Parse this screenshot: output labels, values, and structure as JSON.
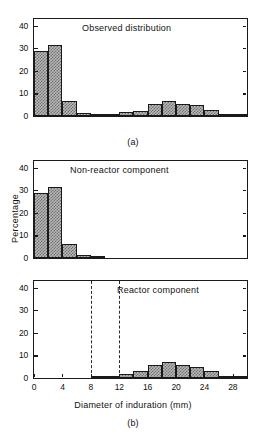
{
  "figure": {
    "y_axis_label": "Percentage",
    "x_axis_label": "Diameter of induration (mm)",
    "label_a": "(a)",
    "label_b": "(b)",
    "y_ticks": [
      0,
      10,
      20,
      30,
      40
    ],
    "x_ticks": [
      0,
      4,
      8,
      12,
      16,
      20,
      24,
      28
    ]
  },
  "chart_data": [
    {
      "type": "bar",
      "title": "Observed distribution",
      "panel": "(a)",
      "xlabel": "",
      "ylabel": "Percentage",
      "xlim": [
        0,
        30
      ],
      "ylim": [
        0,
        43
      ],
      "bin_width": 2,
      "grid": false,
      "legend": "none",
      "bin_starts": [
        0,
        2,
        4,
        6,
        8,
        10,
        12,
        14,
        16,
        18,
        20,
        22,
        24,
        26,
        28
      ],
      "categories": [
        "0-2",
        "2-4",
        "4-6",
        "6-8",
        "8-10",
        "10-12",
        "12-14",
        "14-16",
        "16-18",
        "18-20",
        "20-22",
        "22-24",
        "24-26",
        "26-28",
        "28-30"
      ],
      "values": [
        29,
        31.3,
        6.5,
        1.3,
        0.2,
        0.6,
        1.6,
        2.4,
        5.4,
        6.6,
        5.5,
        4.7,
        2.7,
        0.7,
        0.1
      ]
    },
    {
      "type": "bar",
      "title": "Non-reactor component",
      "panel": "(b-top)",
      "xlabel": "",
      "ylabel": "Percentage",
      "xlim": [
        0,
        30
      ],
      "ylim": [
        0,
        43
      ],
      "bin_width": 2,
      "grid": false,
      "legend": "none",
      "bin_starts": [
        0,
        2,
        4,
        6,
        8,
        10,
        12,
        14,
        16,
        18,
        20,
        22,
        24,
        26,
        28
      ],
      "categories": [
        "0-2",
        "2-4",
        "4-6",
        "6-8",
        "8-10",
        "10-12",
        "12-14",
        "14-16",
        "16-18",
        "18-20",
        "20-22",
        "22-24",
        "24-26",
        "26-28",
        "28-30"
      ],
      "values": [
        29,
        31.3,
        6.4,
        1.3,
        0.1,
        0,
        0,
        0,
        0,
        0,
        0,
        0,
        0,
        0,
        0
      ]
    },
    {
      "type": "bar",
      "title": "Reactor component",
      "panel": "(b-bottom)",
      "xlabel": "Diameter of induration (mm)",
      "ylabel": "Percentage",
      "xlim": [
        0,
        30
      ],
      "ylim": [
        0,
        43
      ],
      "bin_width": 2,
      "grid": false,
      "legend": "none",
      "annotations": [
        {
          "type": "vline",
          "x": 8,
          "style": "dashed"
        },
        {
          "type": "vline",
          "x": 12,
          "style": "dashed"
        }
      ],
      "bin_starts": [
        0,
        2,
        4,
        6,
        8,
        10,
        12,
        14,
        16,
        18,
        20,
        22,
        24,
        26,
        28
      ],
      "categories": [
        "0-2",
        "2-4",
        "4-6",
        "6-8",
        "8-10",
        "10-12",
        "12-14",
        "14-16",
        "16-18",
        "18-20",
        "20-22",
        "22-24",
        "24-26",
        "26-28",
        "28-30"
      ],
      "values": [
        0,
        0,
        0,
        0,
        0.1,
        0.6,
        1.6,
        3.1,
        5.7,
        6.9,
        5.6,
        5.0,
        2.9,
        0.7,
        0.1
      ]
    }
  ]
}
